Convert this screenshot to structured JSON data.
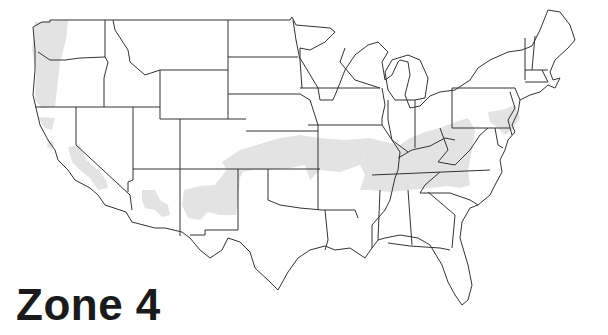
{
  "map": {
    "title": "Zone 4",
    "region": "Contiguous United States",
    "zone_fill_color": "#e3e3e3",
    "border_color": "#333333",
    "shaded_zones": [
      {
        "name": "pacific-northwest-coast",
        "label": "Coastal Washington / Oregon"
      },
      {
        "name": "northern-california",
        "label": "Northern California interior"
      },
      {
        "name": "central-california",
        "label": "Central Valley California"
      },
      {
        "name": "arizona-highlands",
        "label": "Central Arizona"
      },
      {
        "name": "new-mexico-highlands",
        "label": "New Mexico"
      },
      {
        "name": "central-band",
        "label": "Kansas / Missouri / Oklahoma panhandle"
      },
      {
        "name": "ohio-valley",
        "label": "Kentucky / Tennessee / Virginia / North Carolina"
      },
      {
        "name": "mid-atlantic",
        "label": "Maryland / Delaware / New Jersey / Pennsylvania"
      }
    ]
  }
}
